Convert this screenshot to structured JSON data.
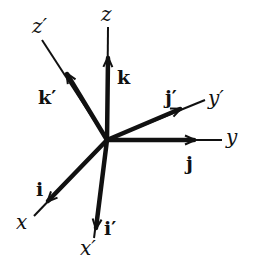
{
  "figure": {
    "origin": {
      "x": 107,
      "y": 140
    },
    "stroke_color": "#111111",
    "background": "#ffffff"
  },
  "axes": [
    {
      "id": "z",
      "label": "z",
      "end": {
        "x": 108,
        "y": 27
      },
      "vector": "k"
    },
    {
      "id": "y",
      "label": "y",
      "end": {
        "x": 222,
        "y": 140
      },
      "vector": "j"
    },
    {
      "id": "x",
      "label": "x",
      "end": {
        "x": 34,
        "y": 216
      },
      "vector": "i"
    },
    {
      "id": "z-prime",
      "label": "z′",
      "end": {
        "x": 42,
        "y": 40
      },
      "vector": "k′"
    },
    {
      "id": "y-prime",
      "label": "y′",
      "end": {
        "x": 205,
        "y": 100
      },
      "vector": "j′"
    },
    {
      "id": "x-prime",
      "label": "x′",
      "end": {
        "x": 94,
        "y": 238
      },
      "vector": "i′"
    }
  ],
  "labels": {
    "z": "z",
    "y": "y",
    "x": "x",
    "z_prime": "z′",
    "y_prime": "y′",
    "x_prime": "x′",
    "k": "k",
    "j": "j",
    "i": "i",
    "k_prime": "k′",
    "j_prime": "j′",
    "i_prime": "i′"
  },
  "vectors": [
    {
      "name": "k",
      "tip": {
        "x": 108,
        "y": 56
      }
    },
    {
      "name": "j",
      "tip": {
        "x": 196,
        "y": 140
      }
    },
    {
      "name": "i",
      "tip": {
        "x": 46,
        "y": 203
      }
    },
    {
      "name": "k′",
      "tip": {
        "x": 66,
        "y": 72
      }
    },
    {
      "name": "j′",
      "tip": {
        "x": 182,
        "y": 108
      }
    },
    {
      "name": "i′",
      "tip": {
        "x": 96,
        "y": 230
      }
    }
  ]
}
